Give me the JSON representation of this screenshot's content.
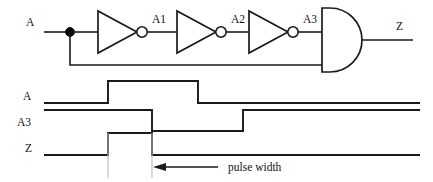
{
  "figure": {
    "stroke_color": "#1a1a1a",
    "background_color": "#ffffff",
    "guide_color": "#b9b9b9"
  },
  "circuit": {
    "input_label": "A",
    "output_label": "Z",
    "node_labels": {
      "n1": "A1",
      "n2": "A2",
      "n3": "A3"
    },
    "gates": [
      {
        "type": "inverter",
        "name": "inverter-1",
        "output_node": "A1"
      },
      {
        "type": "inverter",
        "name": "inverter-2",
        "output_node": "A2"
      },
      {
        "type": "inverter",
        "name": "inverter-3",
        "output_node": "A3"
      },
      {
        "type": "and",
        "name": "and-gate",
        "inputs": [
          "A3",
          "A"
        ],
        "output": "Z"
      }
    ],
    "junction": {
      "name": "fanout-dot",
      "node": "A"
    }
  },
  "timing": {
    "signals": [
      {
        "label": "A",
        "name": "waveform-a",
        "initial": "low",
        "transitions": [
          "rise",
          "fall"
        ]
      },
      {
        "label": "A3",
        "name": "waveform-a3",
        "initial": "high",
        "transitions": [
          "fall",
          "rise"
        ]
      },
      {
        "label": "Z",
        "name": "waveform-z",
        "initial": "low",
        "transitions": [
          "rise",
          "fall"
        ]
      }
    ],
    "annotation": {
      "text": "pulse width",
      "arrow_direction": "left"
    }
  }
}
